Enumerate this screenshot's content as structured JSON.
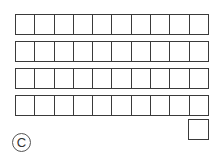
{
  "diagram": {
    "type": "base-ten-blocks",
    "label": "C",
    "rods": [
      {
        "cells": 10,
        "top": 14
      },
      {
        "cells": 10,
        "top": 41
      },
      {
        "cells": 10,
        "top": 68
      },
      {
        "cells": 10,
        "top": 95
      }
    ],
    "units": 1,
    "represented_value": 41,
    "stroke_color": "#3a3a3a"
  }
}
